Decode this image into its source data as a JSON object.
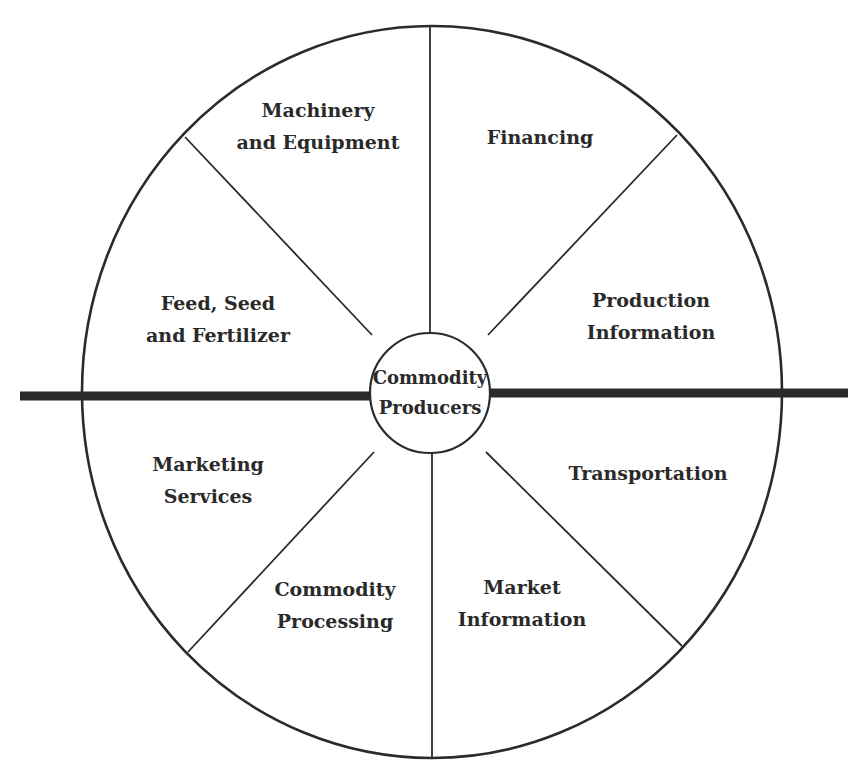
{
  "diagram": {
    "type": "wheel",
    "center": {
      "line1": "Commodity",
      "line2": "Producers"
    },
    "segments": [
      {
        "id": "machinery",
        "line1": "Machinery",
        "line2": "and Equipment",
        "position": "top-left"
      },
      {
        "id": "financing",
        "line1": "Financing",
        "line2": "",
        "position": "top-right"
      },
      {
        "id": "production-info",
        "line1": "Production",
        "line2": "Information",
        "position": "upper-right"
      },
      {
        "id": "transportation",
        "line1": "Transportation",
        "line2": "",
        "position": "lower-right"
      },
      {
        "id": "market-info",
        "line1": "Market",
        "line2": "Information",
        "position": "bottom-right"
      },
      {
        "id": "commodity-processing",
        "line1": "Commodity",
        "line2": "Processing",
        "position": "bottom-left"
      },
      {
        "id": "marketing-services",
        "line1": "Marketing",
        "line2": "Services",
        "position": "lower-left"
      },
      {
        "id": "feed-seed",
        "line1": "Feed, Seed",
        "line2": "and Fertilizer",
        "position": "upper-left"
      }
    ],
    "divider": "thick horizontal line separating upper (input suppliers) and lower (output services) halves",
    "colors": {
      "stroke": "#2b2b2b",
      "text": "#2a2a2a",
      "background": "#ffffff"
    }
  }
}
